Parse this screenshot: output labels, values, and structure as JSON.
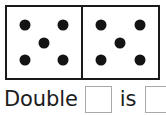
{
  "worksheet": {
    "kind": "domino-doubles-worksheet",
    "background_color": "#ffffff",
    "ink_color": "#141414",
    "box_border_color": "#a9a9a9"
  },
  "domino": {
    "border_color": "#1a1a1a",
    "face_color": "#ffffff",
    "halves": [
      {
        "name": "left-half",
        "pip_count": 5,
        "pips": [
          "top-left",
          "top-right",
          "center",
          "bottom-left",
          "bottom-right"
        ]
      },
      {
        "name": "right-half",
        "pip_count": 5,
        "pips": [
          "top-left",
          "top-right",
          "center",
          "bottom-left",
          "bottom-right"
        ]
      }
    ]
  },
  "sentence": {
    "word_double": "Double",
    "word_is": "is",
    "answer_box_1_value": "",
    "answer_box_2_value": ""
  }
}
